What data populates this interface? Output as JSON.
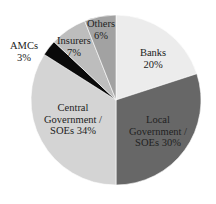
{
  "chart_data": {
    "type": "pie",
    "title": "",
    "start_angle_deg": 0,
    "direction": "clockwise",
    "slices": [
      {
        "label": "Banks",
        "value": 20,
        "color": "#ececec",
        "text_lines": [
          "Banks",
          "20%"
        ]
      },
      {
        "label": "Local Government / SOEs",
        "value": 30,
        "color": "#676767",
        "text_lines": [
          "Local",
          "Government /",
          "SOEs 30%"
        ]
      },
      {
        "label": "Central Government / SOEs",
        "value": 34,
        "color": "#d4d4d4",
        "text_lines": [
          "Central",
          "Government /",
          "SOEs 34%"
        ]
      },
      {
        "label": "AMCs",
        "value": 3,
        "color": "#0a0a0a",
        "text_lines": [
          "AMCs",
          "3%"
        ]
      },
      {
        "label": "Insurers",
        "value": 7,
        "color": "#bdbdbd",
        "text_lines": [
          "Insurers",
          "7%"
        ]
      },
      {
        "label": "Others",
        "value": 6,
        "color": "#a2a2a2",
        "text_lines": [
          "Others",
          "6%"
        ]
      }
    ],
    "legend": "none"
  },
  "labels": {
    "banks": "Banks\n20%",
    "local": "Local\nGovernment /\nSOEs 30%",
    "central": "Central\nGovernment /\nSOEs 34%",
    "amcs": "AMCs\n3%",
    "insurers": "Insurers\n7%",
    "others": "Others\n6%"
  }
}
